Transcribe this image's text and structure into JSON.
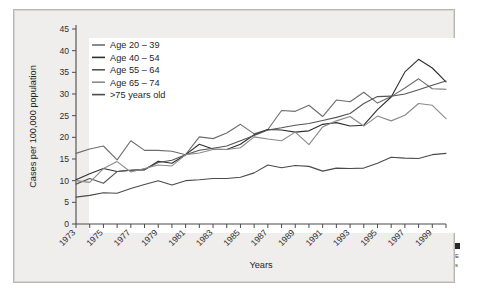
{
  "figure": {
    "background_color": "#efeeec",
    "plot_background_color": "#ffffff",
    "axis_color": "#4b4b4b",
    "caption_fragment_line1": "E",
    "caption_fragment_line2": "s"
  },
  "chart_data": {
    "type": "line",
    "title": "",
    "xlabel": "Years",
    "ylabel": "Cases per 100,000 population",
    "ylim": [
      0,
      45
    ],
    "xlim": [
      1973,
      2000
    ],
    "grid": false,
    "legend_position": "upper-left",
    "ytick_labels": [
      "0",
      "5",
      "10",
      "15",
      "20",
      "25",
      "30",
      "35",
      "40",
      "45"
    ],
    "ytick_values": [
      0,
      5,
      10,
      15,
      20,
      25,
      30,
      35,
      40,
      45
    ],
    "xtick_labels": [
      "1973",
      "1975",
      "1977",
      "1979",
      "1981",
      "1983",
      "1985",
      "1987",
      "1989",
      "1991",
      "1993",
      "1995",
      "1997",
      "1999"
    ],
    "xtick_values": [
      1973,
      1975,
      1977,
      1979,
      1981,
      1983,
      1985,
      1987,
      1989,
      1991,
      1993,
      1995,
      1997,
      1999
    ],
    "x": [
      1973,
      1974,
      1975,
      1976,
      1977,
      1978,
      1979,
      1980,
      1981,
      1982,
      1983,
      1984,
      1985,
      1986,
      1987,
      1988,
      1989,
      1990,
      1991,
      1992,
      1993,
      1994,
      1995,
      1996,
      1997,
      1998,
      1999,
      2000
    ],
    "series": [
      {
        "name": "Age 20 – 39",
        "color": "#6d6d6d",
        "values": [
          16.3,
          17.3,
          18.0,
          14.8,
          19.2,
          17.0,
          17.0,
          16.8,
          16.0,
          20.1,
          19.7,
          21.0,
          23.0,
          20.8,
          21.8,
          26.2,
          26.0,
          27.4,
          24.8,
          28.6,
          28.2,
          30.4,
          27.9,
          29.4,
          31.4,
          33.5,
          31.2,
          31.1
        ]
      },
      {
        "name": "Age 40 – 54",
        "color": "#2f2f2f",
        "values": [
          10.2,
          11.6,
          12.8,
          12.1,
          12.4,
          12.5,
          14.5,
          14.0,
          16.0,
          18.4,
          17.3,
          17.2,
          18.4,
          20.6,
          21.8,
          21.7,
          21.2,
          21.5,
          23.0,
          23.4,
          22.6,
          22.8,
          26.4,
          29.3,
          35.1,
          38.0,
          36.0,
          32.8
        ]
      },
      {
        "name": "Age 55 – 64",
        "color": "#555555",
        "values": [
          9.2,
          10.5,
          9.4,
          12.1,
          12.4,
          12.6,
          14.2,
          14.7,
          16.0,
          17.0,
          17.5,
          18.0,
          19.2,
          20.4,
          21.7,
          22.2,
          22.8,
          23.2,
          23.9,
          24.6,
          25.5,
          27.8,
          29.4,
          29.5,
          30.0,
          31.0,
          32.0,
          33.0
        ]
      },
      {
        "name": "Age 65 – 74",
        "color": "#8a8a8a",
        "values": [
          10.0,
          9.6,
          12.8,
          14.4,
          12.0,
          12.8,
          13.6,
          13.4,
          16.0,
          16.4,
          17.2,
          17.2,
          17.6,
          20.1,
          19.6,
          19.2,
          21.2,
          18.3,
          22.4,
          23.8,
          24.8,
          22.6,
          24.9,
          23.8,
          25.1,
          27.8,
          27.4,
          24.3
        ]
      },
      {
        "name": ">75 years old",
        "color": "#4a4a4a",
        "values": [
          6.2,
          6.6,
          7.2,
          7.1,
          8.2,
          9.1,
          10.0,
          9.0,
          10.0,
          10.2,
          10.5,
          10.5,
          10.8,
          11.8,
          13.6,
          13.0,
          13.5,
          13.3,
          12.2,
          12.9,
          12.8,
          12.9,
          14.0,
          15.4,
          15.2,
          15.1,
          16.0,
          16.3
        ]
      }
    ]
  },
  "legend": {
    "items": [
      {
        "label": "Age 20 – 39"
      },
      {
        "label": "Age 40 – 54"
      },
      {
        "label": "Age 55 – 64"
      },
      {
        "label": "Age 65 – 74"
      },
      {
        "label": ">75 years old"
      }
    ]
  }
}
